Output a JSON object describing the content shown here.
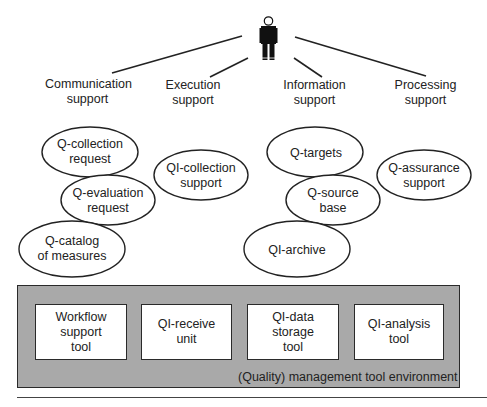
{
  "diagram": {
    "actor": {
      "icon": "person-icon"
    },
    "support_categories": [
      {
        "id": "communication",
        "label_line1": "Communication",
        "label_line2": "support"
      },
      {
        "id": "execution",
        "label_line1": "Execution",
        "label_line2": "support"
      },
      {
        "id": "information",
        "label_line1": "Information",
        "label_line2": "support"
      },
      {
        "id": "processing",
        "label_line1": "Processing",
        "label_line2": "support"
      }
    ],
    "ellipses": [
      {
        "id": "q-collection-request",
        "line1": "Q-collection",
        "line2": "request",
        "group": "communication"
      },
      {
        "id": "q-evaluation-request",
        "line1": "Q-evaluation",
        "line2": "request",
        "group": "communication"
      },
      {
        "id": "q-catalog-of-measures",
        "line1": "Q-catalog",
        "line2": "of measures",
        "group": "communication"
      },
      {
        "id": "qi-collection-support",
        "line1": "QI-collection",
        "line2": "support",
        "group": "execution"
      },
      {
        "id": "q-targets",
        "line1": "Q-targets",
        "line2": "",
        "group": "information"
      },
      {
        "id": "q-source-base",
        "line1": "Q-source",
        "line2": "base",
        "group": "information"
      },
      {
        "id": "qi-archive",
        "line1": "QI-archive",
        "line2": "",
        "group": "information"
      },
      {
        "id": "q-assurance-support",
        "line1": "Q-assurance",
        "line2": "support",
        "group": "processing"
      }
    ],
    "environment": {
      "label": "(Quality) management tool environment",
      "fill_color": "#a9a9a9",
      "tools": [
        {
          "id": "workflow-support-tool",
          "line1": "Workflow",
          "line2": "support",
          "line3": "tool"
        },
        {
          "id": "qi-receive-unit",
          "line1": "QI-receive",
          "line2": "unit",
          "line3": ""
        },
        {
          "id": "qi-data-storage-tool",
          "line1": "QI-data",
          "line2": "storage",
          "line3": "tool"
        },
        {
          "id": "qi-analysis-tool",
          "line1": "QI-analysis",
          "line2": "tool",
          "line3": ""
        }
      ]
    }
  }
}
